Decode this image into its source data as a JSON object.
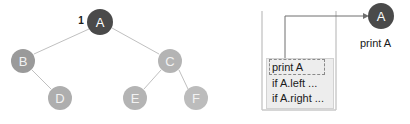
{
  "tree": {
    "step_number": "1",
    "nodes": [
      {
        "id": "A",
        "label": "A",
        "cx": 100,
        "cy": 22,
        "r": 13,
        "fill": "#4a4a4a",
        "text_fill": "#ffffff"
      },
      {
        "id": "B",
        "label": "B",
        "cx": 23,
        "cy": 61,
        "r": 12,
        "fill": "#9a9a9a",
        "text_fill": "#f0f0f0"
      },
      {
        "id": "C",
        "label": "C",
        "cx": 170,
        "cy": 61,
        "r": 12,
        "fill": "#b4b4b4",
        "text_fill": "#f4f4f4"
      },
      {
        "id": "D",
        "label": "D",
        "cx": 60,
        "cy": 98,
        "r": 12,
        "fill": "#aeaeae",
        "text_fill": "#f4f4f4"
      },
      {
        "id": "E",
        "label": "E",
        "cx": 135,
        "cy": 98,
        "r": 12,
        "fill": "#b4b4b4",
        "text_fill": "#f4f4f4"
      },
      {
        "id": "F",
        "label": "F",
        "cx": 196,
        "cy": 98,
        "r": 12,
        "fill": "#bcbcbc",
        "text_fill": "#f6f6f6"
      }
    ],
    "edges": [
      {
        "from": "A",
        "to": "B"
      },
      {
        "from": "A",
        "to": "C"
      },
      {
        "from": "B",
        "to": "D"
      },
      {
        "from": "C",
        "to": "E"
      },
      {
        "from": "C",
        "to": "F"
      }
    ],
    "edge_color": "#c0c0c0"
  },
  "stack": {
    "container_color": "#c8c8c8",
    "frame_fill": "#ededed",
    "frame_border": "#d2d2d2",
    "lines": [
      {
        "text": "print A",
        "highlighted": true
      },
      {
        "text": "if A.left ...",
        "highlighted": false
      },
      {
        "text": "if A.right ...",
        "highlighted": false
      }
    ]
  },
  "output": {
    "node_label": "A",
    "node_fill": "#4a4a4a",
    "caption": "print A",
    "arrow_color": "#6e6e6e"
  }
}
